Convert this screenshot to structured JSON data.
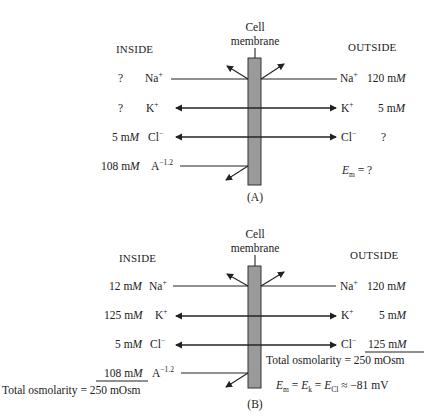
{
  "panel_a": {
    "label": "(A)",
    "membrane_label_1": "Cell",
    "membrane_label_2": "membrane",
    "inside_header": "INSIDE",
    "outside_header": "OUTSIDE",
    "rows": [
      {
        "ion": "Na",
        "charge": "+",
        "inside_conc": "?",
        "outside_conc": "120 m",
        "outside_unit": "M",
        "direction": "both-blocked"
      },
      {
        "ion": "K",
        "charge": "+",
        "inside_conc": "?",
        "outside_conc": "5 m",
        "outside_unit": "M",
        "direction": "bidirectional"
      },
      {
        "ion": "Cl",
        "charge": "−",
        "inside_conc": "5 m",
        "inside_unit": "M",
        "outside_conc": "?",
        "direction": "bidirectional"
      },
      {
        "ion": "A",
        "charge": "−1.2",
        "inside_conc": "108 m",
        "inside_unit": "M",
        "direction": "blocked"
      }
    ],
    "em_symbol": "E",
    "em_sub": "m",
    "em_value": "= ?"
  },
  "panel_b": {
    "label": "(B)",
    "membrane_label_1": "Cell",
    "membrane_label_2": "membrane",
    "inside_header": "INSIDE",
    "outside_header": "OUTSIDE",
    "rows": [
      {
        "ion": "Na",
        "charge": "+",
        "inside_conc": "12 m",
        "inside_unit": "M",
        "outside_conc": "120 m",
        "outside_unit": "M"
      },
      {
        "ion": "K",
        "charge": "+",
        "inside_conc": "125 m",
        "inside_unit": "M",
        "outside_conc": "5 m",
        "outside_unit": "M"
      },
      {
        "ion": "Cl",
        "charge": "−",
        "inside_conc": "5 m",
        "inside_unit": "M",
        "outside_conc": "125 m",
        "outside_unit": "M"
      },
      {
        "ion": "A",
        "charge": "−1.2",
        "inside_conc": "108 m",
        "inside_unit": "M"
      }
    ],
    "inside_total": "Total osmolarity = 250 mOsm",
    "outside_total": "Total osmolarity = 250 mOsm",
    "em_equation": {
      "e": "E",
      "m": "m",
      "eq1": " = ",
      "k": "k",
      "eq2": " = ",
      "cl": "Cl",
      "approx": " ≈ −81 mV"
    }
  }
}
